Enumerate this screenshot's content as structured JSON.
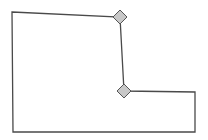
{
  "diagram": {
    "type": "polygon-shape-with-edit-handles",
    "colors": {
      "background": "#ffffff",
      "outline": "#4a4a4a",
      "handle_fill": "#c8c8c8",
      "handle_stroke": "#555555"
    },
    "outline_points": [
      [
        12,
        12
      ],
      [
        120,
        17
      ],
      [
        124,
        91
      ],
      [
        195,
        92
      ],
      [
        195,
        132
      ],
      [
        13,
        132
      ]
    ],
    "handles": [
      {
        "name": "vertex-handle-top",
        "cx": 120,
        "cy": 17,
        "size": 7
      },
      {
        "name": "vertex-handle-middle",
        "cx": 124,
        "cy": 91,
        "size": 7
      }
    ]
  }
}
